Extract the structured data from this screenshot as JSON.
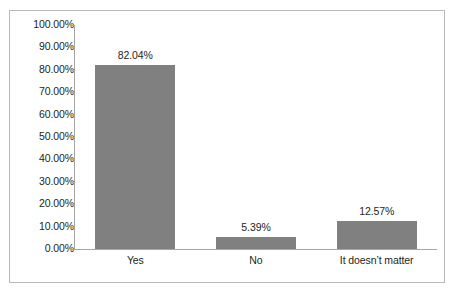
{
  "chart_data": {
    "type": "bar",
    "title": "",
    "subtitle": "",
    "xlabel": "",
    "ylabel": "",
    "categories": [
      "Yes",
      "No",
      "It doesn’t matter"
    ],
    "values": [
      82.04,
      5.39,
      12.57
    ],
    "value_labels": [
      "82.04%",
      "5.39%",
      "12.57%"
    ],
    "ylim": [
      0,
      100
    ],
    "ytick_values": [
      0,
      10,
      20,
      30,
      40,
      50,
      60,
      70,
      80,
      90,
      100
    ],
    "ytick_labels": [
      "0.00%",
      "10.00%",
      "20.00%",
      "30.00%",
      "40.00%",
      "50.00%",
      "60.00%",
      "70.00%",
      "80.00%",
      "90.00%",
      "100.00%"
    ],
    "grid": false,
    "legend": false,
    "legend_position": "none",
    "series": [
      {
        "name": "",
        "values": [
          82.04,
          5.39,
          12.57
        ],
        "color": "#808080"
      }
    ],
    "colors": {
      "bar": "#808080",
      "axis": "#a6a6a6",
      "frame_border": "#b9b9b9",
      "text": "#231f20",
      "plot_background": "#ffffff"
    }
  }
}
